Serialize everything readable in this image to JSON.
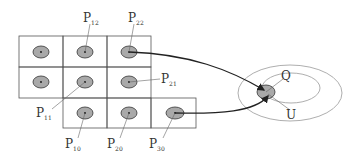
{
  "diagram": {
    "grid_cells": [
      {
        "row": 0,
        "col": 0
      },
      {
        "row": 0,
        "col": 1
      },
      {
        "row": 0,
        "col": 2
      },
      {
        "row": 1,
        "col": 0
      },
      {
        "row": 1,
        "col": 1
      },
      {
        "row": 1,
        "col": 2
      },
      {
        "row": 2,
        "col": 1
      },
      {
        "row": 2,
        "col": 2
      },
      {
        "row": 2,
        "col": 3
      }
    ],
    "labels": {
      "p12": {
        "main": "P",
        "sub": "12"
      },
      "p22": {
        "main": "P",
        "sub": "22"
      },
      "p21": {
        "main": "P",
        "sub": "21"
      },
      "p11": {
        "main": "P",
        "sub": "11"
      },
      "p10": {
        "main": "P",
        "sub": "10"
      },
      "p20": {
        "main": "P",
        "sub": "20"
      },
      "p30": {
        "main": "P",
        "sub": "30"
      },
      "q": {
        "main": "Q"
      },
      "u": {
        "main": "U"
      }
    },
    "colors": {
      "cell_border": "#555555",
      "blob_fill": "#a9a9a9",
      "blob_stroke": "#333333",
      "ellipse_stroke": "#999999",
      "arrow": "#222222"
    }
  }
}
